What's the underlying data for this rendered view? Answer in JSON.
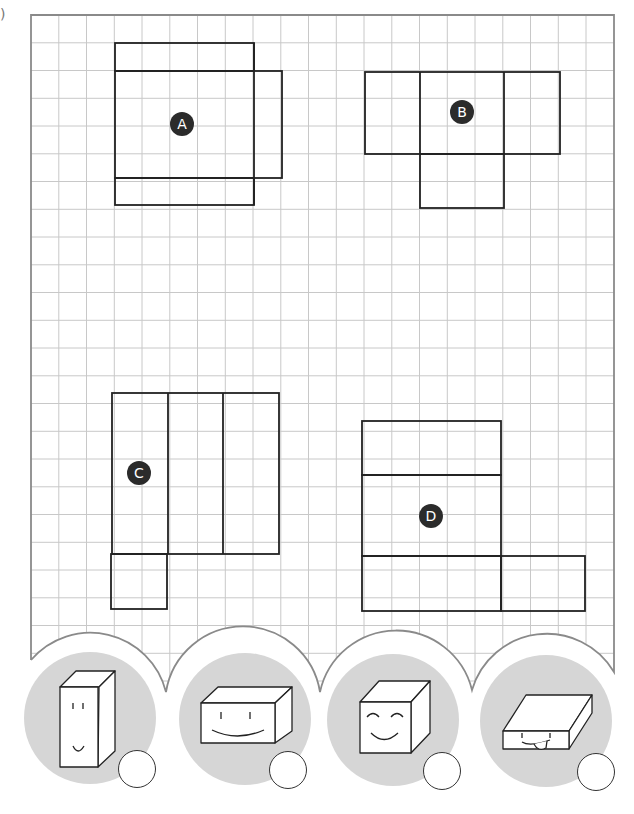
{
  "page": {
    "corner_mark": ")",
    "grid": {
      "left": 31,
      "top": 15,
      "right": 614,
      "bottom": 672,
      "cell": 27.75,
      "line_color": "#c8c8c8",
      "border_color": "#8a8a8a"
    }
  },
  "nets": [
    {
      "label": "A",
      "badge_x": 182,
      "badge_y": 124
    },
    {
      "label": "B",
      "badge_x": 462,
      "badge_y": 112
    },
    {
      "label": "C",
      "badge_x": 139,
      "badge_y": 473
    },
    {
      "label": "D",
      "badge_x": 431,
      "badge_y": 516
    }
  ],
  "choices": [
    {
      "name": "tall-box",
      "face": "smile-dots",
      "cx": 90,
      "circle_x": 137,
      "circle_y": 769
    },
    {
      "name": "wide-box",
      "face": "wide-smile",
      "cx": 245,
      "circle_x": 288,
      "circle_y": 770
    },
    {
      "name": "cube",
      "face": "happy-closed-eyes",
      "cx": 393,
      "circle_x": 442,
      "circle_y": 771
    },
    {
      "name": "flat-box",
      "face": "tongue-out",
      "cx": 546,
      "circle_x": 596,
      "circle_y": 772
    }
  ],
  "colors": {
    "badge": "#2b2b2b",
    "bubble_fill": "#d6d6d6",
    "bump_stroke": "#8a8a8a",
    "shape_stroke": "#222222"
  }
}
